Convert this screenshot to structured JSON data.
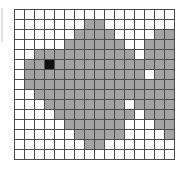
{
  "figure": {
    "name": "pixel-grid-fish",
    "grid": {
      "columns": 16,
      "rows": 15,
      "cell_size_px": 10,
      "origin_x_px": 14,
      "origin_y_px": 9,
      "line_color": "#4a4a4a",
      "grid_visible": true
    },
    "palette": {
      "empty": "#ffffff",
      "fill": "#a3a3a3",
      "eye": "#101010",
      "background": "#ffffff"
    },
    "legend": {
      "empty_label": "unshaded",
      "fill_label": "shaded (body)",
      "eye_label": "eye (black)"
    },
    "eye_cell": {
      "column": 3,
      "row": 5
    },
    "cells": [
      [
        0,
        0,
        0,
        0,
        0,
        0,
        0,
        0,
        0,
        0,
        0,
        0,
        0,
        0,
        0,
        0
      ],
      [
        0,
        0,
        0,
        0,
        0,
        0,
        0,
        1,
        1,
        0,
        0,
        0,
        0,
        0,
        0,
        0
      ],
      [
        0,
        0,
        0,
        0,
        0,
        0,
        1,
        1,
        1,
        1,
        0,
        0,
        0,
        0,
        1,
        1
      ],
      [
        0,
        0,
        0,
        0,
        0,
        1,
        1,
        1,
        1,
        1,
        1,
        0,
        0,
        1,
        1,
        1
      ],
      [
        0,
        0,
        1,
        1,
        1,
        1,
        1,
        1,
        1,
        1,
        1,
        1,
        0,
        1,
        1,
        1
      ],
      [
        0,
        1,
        1,
        2,
        1,
        1,
        1,
        1,
        1,
        1,
        1,
        1,
        1,
        1,
        1,
        1
      ],
      [
        0,
        1,
        1,
        1,
        1,
        1,
        1,
        1,
        1,
        1,
        1,
        1,
        1,
        0,
        1,
        1
      ],
      [
        0,
        1,
        1,
        1,
        1,
        1,
        1,
        1,
        1,
        1,
        1,
        1,
        1,
        1,
        1,
        1
      ],
      [
        0,
        0,
        1,
        1,
        1,
        1,
        1,
        1,
        1,
        1,
        1,
        1,
        1,
        1,
        1,
        1
      ],
      [
        0,
        0,
        0,
        1,
        1,
        1,
        1,
        1,
        1,
        1,
        1,
        0,
        1,
        1,
        1,
        1
      ],
      [
        0,
        0,
        0,
        0,
        1,
        1,
        1,
        1,
        1,
        1,
        1,
        1,
        0,
        1,
        1,
        1
      ],
      [
        0,
        0,
        0,
        0,
        0,
        1,
        1,
        1,
        1,
        1,
        1,
        0,
        0,
        0,
        1,
        1
      ],
      [
        0,
        0,
        0,
        0,
        0,
        0,
        1,
        1,
        1,
        1,
        1,
        0,
        0,
        0,
        0,
        1
      ],
      [
        0,
        0,
        0,
        0,
        0,
        0,
        0,
        1,
        1,
        0,
        0,
        0,
        0,
        0,
        0,
        0
      ],
      [
        0,
        0,
        0,
        0,
        0,
        0,
        0,
        0,
        0,
        0,
        0,
        0,
        0,
        0,
        0,
        0
      ]
    ]
  }
}
